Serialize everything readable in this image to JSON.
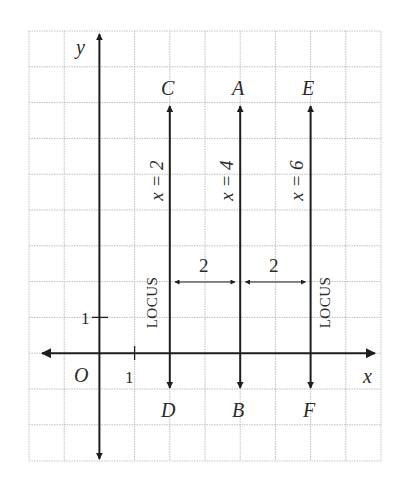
{
  "figure": {
    "title": "",
    "grid": {
      "columns": 10,
      "rows": 12,
      "cell_px": [
        35.2,
        35.8
      ],
      "color": "#bdbdbd"
    },
    "axes": {
      "x_label": "x",
      "y_label": "y",
      "origin_label": "O",
      "x_tick_label": "1",
      "y_tick_label": "1",
      "color": "#1e1e1e"
    },
    "lines": [
      {
        "equation": "x = 2",
        "top_label": "C",
        "bottom_label": "D",
        "x": 2,
        "side_label": "LOCUS"
      },
      {
        "equation": "x = 4",
        "top_label": "A",
        "bottom_label": "B",
        "x": 4
      },
      {
        "equation": "x = 6",
        "top_label": "E",
        "bottom_label": "F",
        "x": 6,
        "side_label": "LOCUS"
      }
    ],
    "distance_markers": [
      {
        "from_x": 2,
        "to_x": 4,
        "label": "2"
      },
      {
        "from_x": 4,
        "to_x": 6,
        "label": "2"
      }
    ],
    "locus_label": "LOCUS"
  }
}
